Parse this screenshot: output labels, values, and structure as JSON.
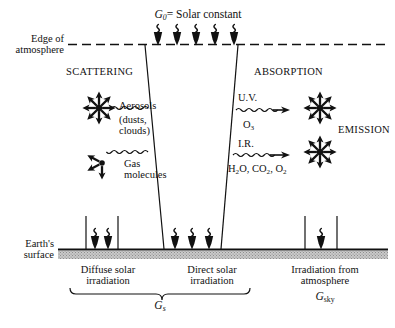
{
  "figure": {
    "type": "atmospheric-solar-radiation-diagram",
    "background": "#ffffff",
    "ink": "#111111",
    "ground_fill": "#c9c9c9"
  },
  "top": {
    "solar_constant_label": "= Solar  constant",
    "solar_constant_symbol": "G",
    "solar_constant_subscript": "0",
    "incoming_arrow_count": 5
  },
  "atmosphere": {
    "edge_label_line1": "Edge of",
    "edge_label_line2": "atmosphere",
    "edge_line_style": "dashed"
  },
  "headings": {
    "scattering": "SCATTERING",
    "absorption": "ABSORPTION",
    "emission": "EMISSION"
  },
  "scattering": {
    "aerosols_line1": "Aerosols",
    "aerosols_line2": "(dusts,",
    "aerosols_line3": "clouds)",
    "gas_line1": "Gas",
    "gas_line2": "molecules"
  },
  "absorption": {
    "uv_label": "U.V.",
    "uv_species": "O",
    "uv_species_sub": "3",
    "ir_label": "I.R.",
    "ir_species_parts": [
      {
        "text": "H",
        "sub": "2"
      },
      {
        "text": "O, CO",
        "sub": "2"
      },
      {
        "text": ", O",
        "sub": "2"
      }
    ]
  },
  "surface": {
    "label_line1": "Earth's",
    "label_line2": "surface"
  },
  "ground_labels": {
    "diffuse_line1": "Diffuse solar",
    "diffuse_line2": "irradiation",
    "direct_line1": "Direct  solar",
    "direct_line2": "irradiation",
    "sky_line1": "Irradiation  from",
    "sky_line2": "atmosphere",
    "gs_symbol": "G",
    "gs_subscript": "s",
    "gsky_symbol": "G",
    "gsky_subscript": "sky"
  },
  "arrows": {
    "diffuse_count": 2,
    "direct_count": 3,
    "sky_count": 1
  }
}
